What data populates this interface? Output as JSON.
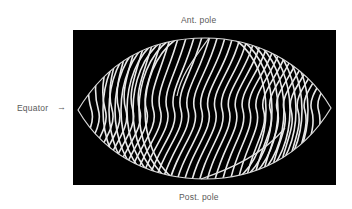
{
  "figure": {
    "labels": {
      "top": "Ant. pole",
      "bottom": "Post. pole",
      "left": "Equator",
      "left_arrow": "→"
    },
    "colors": {
      "background": "#ffffff",
      "panel": "#000000",
      "lines": "#e8e8e8",
      "label_text": "#5a5a5a"
    }
  }
}
